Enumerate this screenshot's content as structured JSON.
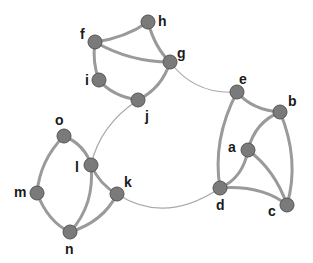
{
  "diagram": {
    "type": "undirected-graph",
    "node_color": "#7a7a7a",
    "edge_color": "#9a9a9a",
    "nodes": [
      {
        "id": "a",
        "label": "a",
        "x": 248,
        "y": 150,
        "lx": 228,
        "ly": 152
      },
      {
        "id": "b",
        "label": "b",
        "x": 280,
        "y": 112,
        "lx": 288,
        "ly": 106
      },
      {
        "id": "c",
        "label": "c",
        "x": 287,
        "y": 205,
        "lx": 268,
        "ly": 216
      },
      {
        "id": "d",
        "label": "d",
        "x": 220,
        "y": 188,
        "lx": 216,
        "ly": 210
      },
      {
        "id": "e",
        "label": "e",
        "x": 237,
        "y": 92,
        "lx": 239,
        "ly": 84
      },
      {
        "id": "f",
        "label": "f",
        "x": 95,
        "y": 42,
        "lx": 80,
        "ly": 39
      },
      {
        "id": "g",
        "label": "g",
        "x": 170,
        "y": 62,
        "lx": 177,
        "ly": 58
      },
      {
        "id": "h",
        "label": "h",
        "x": 148,
        "y": 22,
        "lx": 158,
        "ly": 26
      },
      {
        "id": "i",
        "label": "i",
        "x": 99,
        "y": 80,
        "lx": 85,
        "ly": 85
      },
      {
        "id": "j",
        "label": "j",
        "x": 138,
        "y": 100,
        "lx": 145,
        "ly": 121
      },
      {
        "id": "k",
        "label": "k",
        "x": 117,
        "y": 194,
        "lx": 124,
        "ly": 187
      },
      {
        "id": "l",
        "label": "l",
        "x": 91,
        "y": 165,
        "lx": 75,
        "ly": 172
      },
      {
        "id": "m",
        "label": "m",
        "x": 37,
        "y": 193,
        "lx": 14,
        "ly": 197
      },
      {
        "id": "n",
        "label": "n",
        "x": 70,
        "y": 232,
        "lx": 65,
        "ly": 254
      },
      {
        "id": "o",
        "label": "o",
        "x": 64,
        "y": 136,
        "lx": 55,
        "ly": 125
      }
    ],
    "edges": [
      {
        "from": "f",
        "to": "h",
        "weight": "thick"
      },
      {
        "from": "f",
        "to": "g",
        "weight": "thick"
      },
      {
        "from": "h",
        "to": "g",
        "weight": "thick"
      },
      {
        "from": "f",
        "to": "i",
        "weight": "thick"
      },
      {
        "from": "i",
        "to": "j",
        "weight": "thick"
      },
      {
        "from": "j",
        "to": "g",
        "weight": "thick"
      },
      {
        "from": "g",
        "to": "e",
        "weight": "thin"
      },
      {
        "from": "j",
        "to": "l",
        "weight": "thin"
      },
      {
        "from": "e",
        "to": "b",
        "weight": "thick"
      },
      {
        "from": "e",
        "to": "d",
        "weight": "thick"
      },
      {
        "from": "b",
        "to": "a",
        "weight": "thick"
      },
      {
        "from": "b",
        "to": "c",
        "weight": "thick"
      },
      {
        "from": "a",
        "to": "d",
        "weight": "thick"
      },
      {
        "from": "a",
        "to": "c",
        "weight": "thick"
      },
      {
        "from": "d",
        "to": "c",
        "weight": "thick"
      },
      {
        "from": "k",
        "to": "d",
        "weight": "thin"
      },
      {
        "from": "o",
        "to": "l",
        "weight": "thick"
      },
      {
        "from": "o",
        "to": "m",
        "weight": "thick"
      },
      {
        "from": "m",
        "to": "n",
        "weight": "thick"
      },
      {
        "from": "l",
        "to": "n",
        "weight": "thick"
      },
      {
        "from": "l",
        "to": "k",
        "weight": "thick"
      },
      {
        "from": "k",
        "to": "n",
        "weight": "thick"
      }
    ]
  }
}
